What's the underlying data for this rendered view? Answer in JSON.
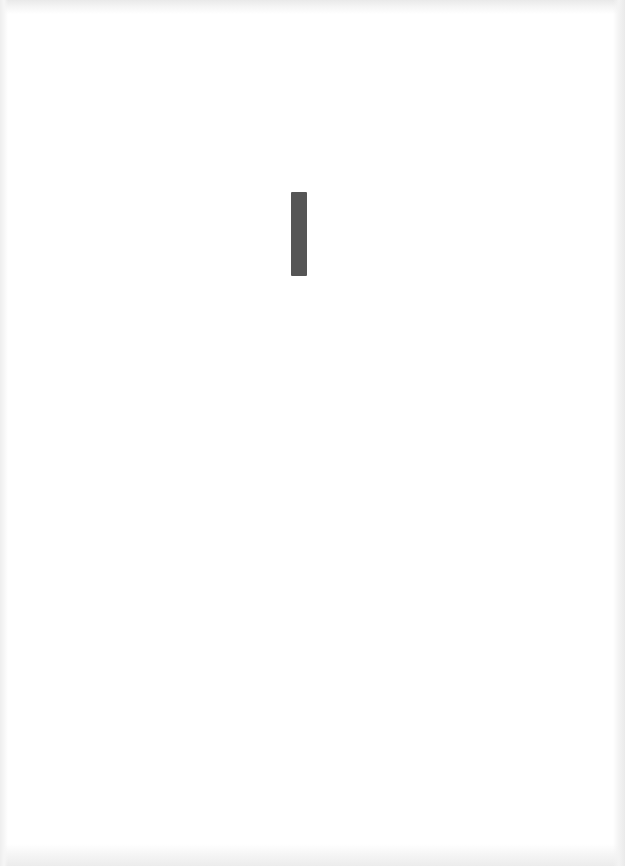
{
  "page": {
    "background_color": "#ffffff",
    "edge_shade_color": "#ebebeb",
    "text": ""
  },
  "marks": [
    {
      "type": "vertical-bar",
      "color": "#555555",
      "x": 291,
      "y": 192,
      "width": 16,
      "height": 84
    }
  ]
}
